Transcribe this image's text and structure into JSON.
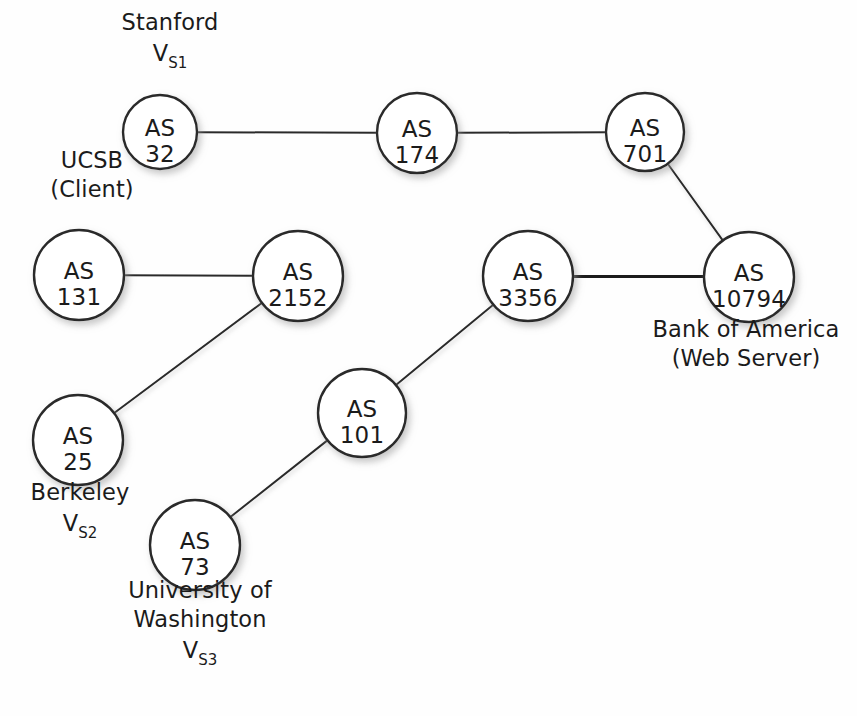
{
  "figure": {
    "background_color": "#fefefe",
    "node_fill": "#ffffff",
    "node_stroke": "#2a2a2a",
    "edge_color": "#2a2a2a",
    "highlight_edge_color": "#1b1b1b",
    "text_color": "#1b1b1b"
  },
  "nodes": [
    {
      "id": "as32",
      "as_text": "AS",
      "number": "32",
      "cx": 160,
      "cy": 132,
      "r": 37
    },
    {
      "id": "as174",
      "as_text": "AS",
      "number": "174",
      "cx": 417,
      "cy": 133,
      "r": 40
    },
    {
      "id": "as701",
      "as_text": "AS",
      "number": "701",
      "cx": 645,
      "cy": 132,
      "r": 39
    },
    {
      "id": "as131",
      "as_text": "AS",
      "number": "131",
      "cx": 79,
      "cy": 275,
      "r": 45
    },
    {
      "id": "as2152",
      "as_text": "AS",
      "number": "2152",
      "cx": 298,
      "cy": 276,
      "r": 45
    },
    {
      "id": "as3356",
      "as_text": "AS",
      "number": "3356",
      "cx": 528,
      "cy": 276,
      "r": 45
    },
    {
      "id": "as10794",
      "as_text": "AS",
      "number": "10794",
      "cx": 749,
      "cy": 277,
      "r": 45
    },
    {
      "id": "as25",
      "as_text": "AS",
      "number": "25",
      "cx": 78,
      "cy": 440,
      "r": 45
    },
    {
      "id": "as101",
      "as_text": "AS",
      "number": "101",
      "cx": 362,
      "cy": 413,
      "r": 44
    },
    {
      "id": "as73",
      "as_text": "AS",
      "number": "73",
      "cx": 195,
      "cy": 545,
      "r": 45
    }
  ],
  "edges": [
    {
      "from": "as32",
      "to": "as174",
      "highlighted": false,
      "width": 2
    },
    {
      "from": "as174",
      "to": "as701",
      "highlighted": false,
      "width": 2
    },
    {
      "from": "as701",
      "to": "as10794",
      "highlighted": false,
      "width": 2
    },
    {
      "from": "as131",
      "to": "as2152",
      "highlighted": false,
      "width": 2
    },
    {
      "from": "as2152",
      "to": "as3356",
      "highlighted": true,
      "width": 7
    },
    {
      "from": "as3356",
      "to": "as10794",
      "highlighted": true,
      "width": 7
    },
    {
      "from": "as25",
      "to": "as2152",
      "highlighted": false,
      "width": 2
    },
    {
      "from": "as73",
      "to": "as101",
      "highlighted": false,
      "width": 2
    },
    {
      "from": "as101",
      "to": "as3356",
      "highlighted": false,
      "width": 2
    }
  ],
  "annotations": [
    {
      "id": "stanford",
      "node": "as32",
      "lines": [
        "Stanford"
      ],
      "vector": {
        "base": "V",
        "sub": "S1"
      },
      "x": 170,
      "y": 30,
      "align": "center"
    },
    {
      "id": "ucsb",
      "node": "as131",
      "lines": [
        "UCSB",
        "(Client)"
      ],
      "vector": null,
      "x": 92,
      "y": 168,
      "align": "center"
    },
    {
      "id": "berkeley",
      "node": "as25",
      "lines": [
        "Berkeley"
      ],
      "vector": {
        "base": "V",
        "sub": "S2"
      },
      "x": 80,
      "y": 500,
      "align": "center"
    },
    {
      "id": "university-of-washington",
      "node": "as73",
      "lines": [
        "University of",
        "Washington"
      ],
      "vector": {
        "base": "V",
        "sub": "S3"
      },
      "x": 200,
      "y": 598,
      "align": "center"
    },
    {
      "id": "bank-of-america",
      "node": "as10794",
      "lines": [
        "Bank of America",
        "(Web Server)"
      ],
      "vector": null,
      "x": 746,
      "y": 337,
      "align": "center"
    }
  ]
}
